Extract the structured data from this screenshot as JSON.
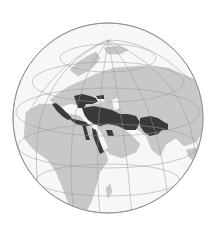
{
  "map": {
    "type": "orthographic-globe",
    "center": {
      "lat": 35,
      "lon": 40
    },
    "colors": {
      "background": "#ffffff",
      "ocean": "#f7f7f7",
      "land": "#c8c8c8",
      "highlight": "#3a3a3a",
      "graticule": "#9a9a9a",
      "outline": "#8a8a8a"
    },
    "highlighted_region": "Empire extent across North Africa, Middle East, Anatolia, Persia and Central Asia"
  }
}
